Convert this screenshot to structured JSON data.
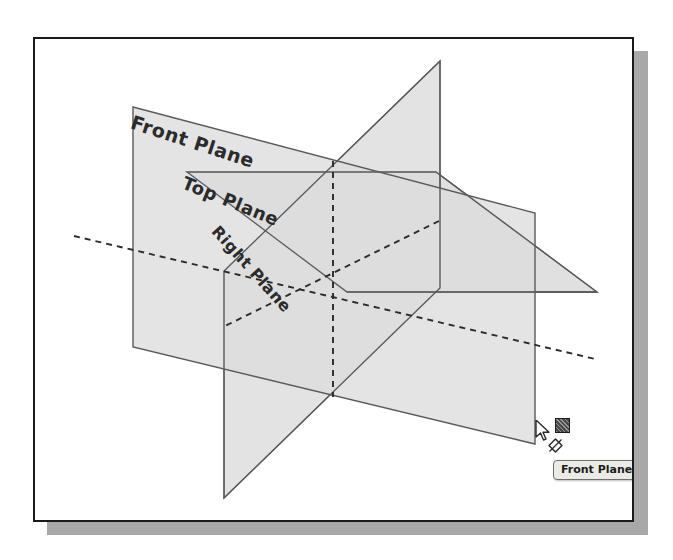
{
  "scene": {
    "title": "SolidWorks default reference planes",
    "background_color": "#ffffff",
    "frame_border_color": "#1a1a1a",
    "frame_shadow_color": "#a8a8a8",
    "plane_fill_color": "#dcdcdc",
    "plane_edge_color": "#5a5a5a",
    "hidden_edge_color": "#2b2b2b"
  },
  "labels": {
    "front_plane": "Front Plane",
    "top_plane": "Top Plane",
    "right_plane": "Right Plane"
  },
  "planes": [
    {
      "name": "front-plane",
      "label": "Front Plane",
      "orientation": "vertical-frontal",
      "highlighted": true
    },
    {
      "name": "top-plane",
      "label": "Top Plane",
      "orientation": "horizontal",
      "highlighted": false
    },
    {
      "name": "right-plane",
      "label": "Right Plane",
      "orientation": "vertical-sagittal",
      "highlighted": false
    }
  ],
  "cursor": {
    "icon": "arrow-cursor",
    "plane_icon": "plane-glyph-icon",
    "select_icon": "diamond-select-icon"
  },
  "tooltip": {
    "text": "Front Plane",
    "background_color": "#eceae4",
    "border_color": "#6e6e6e"
  }
}
